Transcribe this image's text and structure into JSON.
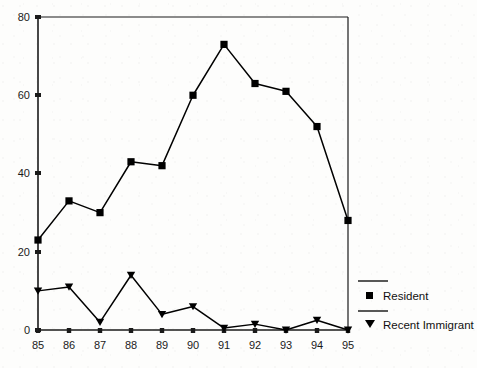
{
  "chart_data": {
    "type": "line",
    "title": "",
    "subtitle": "",
    "xlabel": "",
    "ylabel": "",
    "xlim": [
      85,
      95
    ],
    "ylim": [
      0,
      80
    ],
    "grid": false,
    "legend_position": "right",
    "categories": [
      "85",
      "86",
      "87",
      "88",
      "89",
      "90",
      "91",
      "92",
      "93",
      "94",
      "95"
    ],
    "x_tick_labels": [
      "85",
      "86",
      "87",
      "88",
      "89",
      "90",
      "91",
      "92",
      "93",
      "94",
      "95"
    ],
    "y_tick_labels": [
      "0",
      "20",
      "40",
      "60",
      "80"
    ],
    "y_ticks": [
      0,
      20,
      40,
      60,
      80
    ],
    "series": [
      {
        "name": "Resident",
        "marker": "square",
        "color": "#000000",
        "values": [
          23,
          33,
          30,
          43,
          42,
          60,
          73,
          63,
          61,
          52,
          28
        ]
      },
      {
        "name": "Recent Immigrant",
        "marker": "triangle-down",
        "color": "#000000",
        "values": [
          10,
          11,
          2,
          14,
          4,
          6,
          0.5,
          1.5,
          0,
          2.5,
          0
        ]
      }
    ]
  },
  "legend": {
    "entries": [
      {
        "label": "Resident",
        "marker": "square-marker-icon"
      },
      {
        "label": "Recent Immigrant",
        "marker": "triangle-down-marker-icon"
      }
    ]
  },
  "colors": {
    "axis": "#1a1a1a",
    "series_line": "#111111",
    "background": "#fdfdfc"
  }
}
